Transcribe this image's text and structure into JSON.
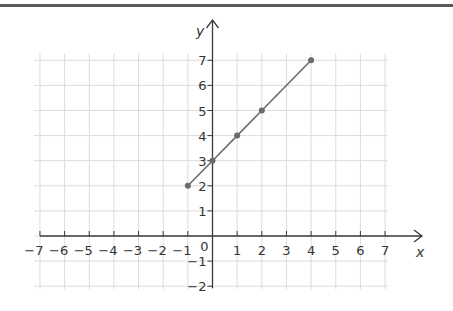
{
  "chart_data": {
    "type": "line",
    "title": "",
    "xlabel": "x",
    "ylabel": "y",
    "xlim": [
      -7,
      7
    ],
    "ylim": [
      -2,
      7
    ],
    "grid": true,
    "x_ticks": [
      -7,
      -6,
      -5,
      -4,
      -3,
      -2,
      -1,
      0,
      1,
      2,
      3,
      4,
      5,
      6,
      7
    ],
    "y_ticks": [
      -2,
      -1,
      1,
      2,
      3,
      4,
      5,
      6,
      7
    ],
    "x_tick_labels": [
      "−7",
      "−6",
      "−5",
      "−4",
      "−3",
      "−2",
      "−1",
      "1",
      "2",
      "3",
      "4",
      "5",
      "6",
      "7"
    ],
    "y_tick_labels": [
      "−2",
      "−1",
      "1",
      "2",
      "3",
      "4",
      "5",
      "6",
      "7"
    ],
    "origin_label": "0",
    "series": [
      {
        "name": "line",
        "x": [
          -1,
          0,
          1,
          2,
          4
        ],
        "y": [
          2,
          3,
          4,
          5,
          7
        ],
        "markers": true,
        "color": "#6b6b6b"
      }
    ],
    "equation_implied": "y = x + 3"
  },
  "colors": {
    "grid": "#dcdcdc",
    "axis": "#3a3a3a",
    "series": "#6b6b6b",
    "top_rule": "#5a5a5a"
  }
}
